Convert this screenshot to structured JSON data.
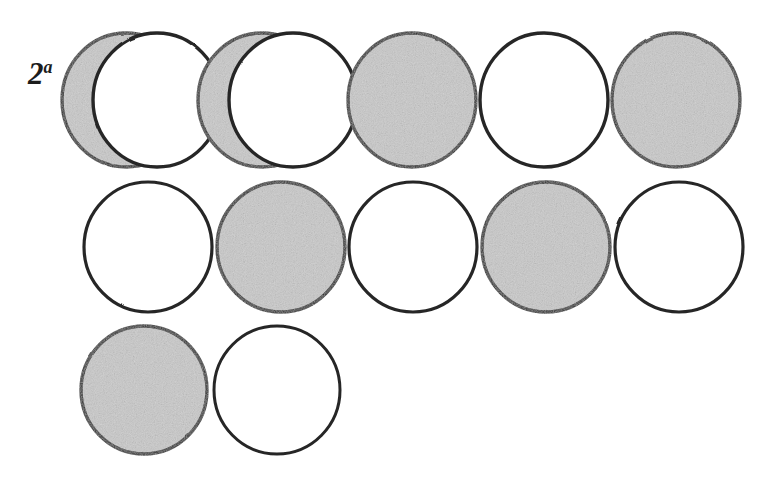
{
  "figure": {
    "label": {
      "base": "2",
      "superscript": "a",
      "full": "2a"
    },
    "canvas": {
      "width": 777,
      "height": 490
    },
    "colors": {
      "background": "#ffffff",
      "stroke": "#262626",
      "shaded_fill": "#c9c9c9",
      "unshaded_fill": "#ffffff",
      "label_color": "#1c1c1c"
    },
    "geometry": {
      "stroke_width": 3.4,
      "circle_rx": 64,
      "circle_ry": 67,
      "overlap_offset_x": 31
    },
    "legend": {
      "shaded_meaning": "shaded",
      "unshaded_meaning": "unshaded",
      "overlap_meaning": "overlapping pair"
    },
    "rows": [
      {
        "index": 1,
        "cy": 100,
        "cells": [
          {
            "position": 1,
            "type": "overlap-pair",
            "back_fill": "shaded",
            "front_fill": "unshaded",
            "cx": 126
          },
          {
            "position": 2,
            "type": "overlap-pair",
            "back_fill": "shaded",
            "front_fill": "unshaded",
            "cx": 262
          },
          {
            "position": 3,
            "type": "single",
            "fill": "shaded",
            "cx": 412
          },
          {
            "position": 4,
            "type": "single",
            "fill": "unshaded",
            "cx": 544
          },
          {
            "position": 5,
            "type": "single",
            "fill": "shaded",
            "cx": 676
          }
        ]
      },
      {
        "index": 2,
        "cy": 247,
        "cells": [
          {
            "position": 1,
            "type": "single",
            "fill": "unshaded",
            "cx": 148
          },
          {
            "position": 2,
            "type": "single",
            "fill": "shaded",
            "cx": 281
          },
          {
            "position": 3,
            "type": "single",
            "fill": "unshaded",
            "cx": 413
          },
          {
            "position": 4,
            "type": "single",
            "fill": "shaded",
            "cx": 546
          },
          {
            "position": 5,
            "type": "single",
            "fill": "unshaded",
            "cx": 679
          }
        ]
      },
      {
        "index": 3,
        "cy": 390,
        "cells": [
          {
            "position": 1,
            "type": "single",
            "fill": "shaded",
            "cx": 144
          },
          {
            "position": 2,
            "type": "single",
            "fill": "unshaded",
            "cx": 277
          }
        ]
      }
    ],
    "counts": {
      "total_circles": 14,
      "shaded": 7,
      "unshaded": 7,
      "overlapping_pairs": 2
    }
  }
}
